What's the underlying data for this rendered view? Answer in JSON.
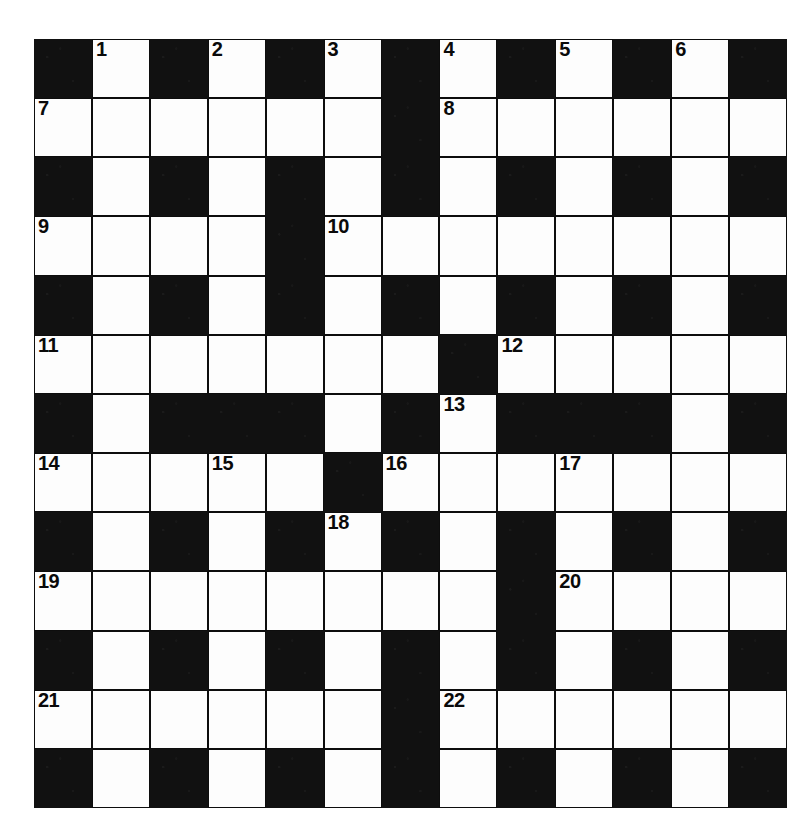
{
  "puzzle": {
    "type": "crossword-grid",
    "rows": 13,
    "cols": 13,
    "colors": {
      "block": "#111111",
      "open": "#fdfdfd",
      "grid_line": "#0d0d0d",
      "number": "#0a0a0a",
      "page_background": "#ffffff"
    },
    "grid": [
      [
        "block",
        "open",
        "block",
        "open",
        "block",
        "open",
        "block",
        "open",
        "block",
        "open",
        "block",
        "open",
        "block"
      ],
      [
        "open",
        "open",
        "open",
        "open",
        "open",
        "open",
        "block",
        "open",
        "open",
        "open",
        "open",
        "open",
        "open"
      ],
      [
        "block",
        "open",
        "block",
        "open",
        "block",
        "open",
        "block",
        "open",
        "block",
        "open",
        "block",
        "open",
        "block"
      ],
      [
        "open",
        "open",
        "open",
        "open",
        "block",
        "open",
        "open",
        "open",
        "open",
        "open",
        "open",
        "open",
        "open"
      ],
      [
        "block",
        "open",
        "block",
        "open",
        "block",
        "open",
        "block",
        "open",
        "block",
        "open",
        "block",
        "open",
        "block"
      ],
      [
        "open",
        "open",
        "open",
        "open",
        "open",
        "open",
        "open",
        "block",
        "open",
        "open",
        "open",
        "open",
        "open"
      ],
      [
        "block",
        "open",
        "block",
        "block",
        "block",
        "open",
        "block",
        "open",
        "block",
        "block",
        "block",
        "open",
        "block"
      ],
      [
        "open",
        "open",
        "open",
        "open",
        "open",
        "block",
        "open",
        "open",
        "open",
        "open",
        "open",
        "open",
        "open"
      ],
      [
        "block",
        "open",
        "block",
        "open",
        "block",
        "open",
        "block",
        "open",
        "block",
        "open",
        "block",
        "open",
        "block"
      ],
      [
        "open",
        "open",
        "open",
        "open",
        "open",
        "open",
        "open",
        "open",
        "block",
        "open",
        "open",
        "open",
        "open"
      ],
      [
        "block",
        "open",
        "block",
        "open",
        "block",
        "open",
        "block",
        "open",
        "block",
        "open",
        "block",
        "open",
        "block"
      ],
      [
        "open",
        "open",
        "open",
        "open",
        "open",
        "open",
        "block",
        "open",
        "open",
        "open",
        "open",
        "open",
        "open"
      ],
      [
        "block",
        "open",
        "block",
        "open",
        "block",
        "open",
        "block",
        "open",
        "block",
        "open",
        "block",
        "open",
        "block"
      ]
    ],
    "numbers": [
      {
        "row": 0,
        "col": 1,
        "label": "1"
      },
      {
        "row": 0,
        "col": 3,
        "label": "2"
      },
      {
        "row": 0,
        "col": 5,
        "label": "3"
      },
      {
        "row": 0,
        "col": 7,
        "label": "4"
      },
      {
        "row": 0,
        "col": 9,
        "label": "5"
      },
      {
        "row": 0,
        "col": 11,
        "label": "6"
      },
      {
        "row": 1,
        "col": 0,
        "label": "7"
      },
      {
        "row": 1,
        "col": 7,
        "label": "8"
      },
      {
        "row": 3,
        "col": 0,
        "label": "9"
      },
      {
        "row": 3,
        "col": 5,
        "label": "10"
      },
      {
        "row": 5,
        "col": 0,
        "label": "11"
      },
      {
        "row": 5,
        "col": 8,
        "label": "12"
      },
      {
        "row": 6,
        "col": 7,
        "label": "13"
      },
      {
        "row": 7,
        "col": 0,
        "label": "14"
      },
      {
        "row": 7,
        "col": 3,
        "label": "15"
      },
      {
        "row": 7,
        "col": 6,
        "label": "16"
      },
      {
        "row": 7,
        "col": 9,
        "label": "17"
      },
      {
        "row": 8,
        "col": 5,
        "label": "18"
      },
      {
        "row": 9,
        "col": 0,
        "label": "19"
      },
      {
        "row": 9,
        "col": 9,
        "label": "20"
      },
      {
        "row": 11,
        "col": 0,
        "label": "21"
      },
      {
        "row": 11,
        "col": 7,
        "label": "22"
      }
    ]
  }
}
